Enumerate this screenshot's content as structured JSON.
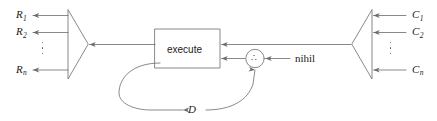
{
  "diagram": {
    "stroke_color": "#6b6b6b",
    "text_color": "#1a1a1a",
    "background": "#ffffff",
    "process_block": {
      "label": "execute"
    },
    "junction_node": {
      "glyph": "∴",
      "glyph_name": "combine-node-dots"
    },
    "outputs": {
      "group_name": "result-outputs",
      "items": [
        {
          "label_base": "R",
          "label_sub": "1",
          "text": "R1"
        },
        {
          "label_base": "R",
          "label_sub": "2",
          "text": "R2"
        },
        {
          "label_base": "R",
          "label_sub": "n",
          "text": "Rn"
        }
      ],
      "ellipsis": "vertical-ellipsis"
    },
    "inputs": {
      "group_name": "command-inputs",
      "items": [
        {
          "label_base": "C",
          "label_sub": "1",
          "text": "C1"
        },
        {
          "label_base": "C",
          "label_sub": "2",
          "text": "C2"
        },
        {
          "label_base": "C",
          "label_sub": "n",
          "text": "Cn"
        }
      ],
      "ellipsis": "vertical-ellipsis"
    },
    "signals": {
      "nihil_label": "nihil",
      "feedback_label": "D"
    }
  }
}
